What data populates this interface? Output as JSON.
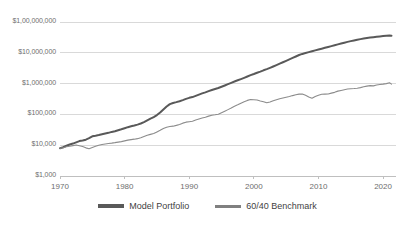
{
  "chart_data": {
    "type": "line",
    "title": "",
    "subtitle": "",
    "xlabel": "",
    "ylabel": "",
    "yscale": "log",
    "ylim": [
      1000,
      100000000
    ],
    "xlim": [
      1970,
      2022
    ],
    "grid": "horizontal",
    "legend_position": "bottom",
    "ytick_labels": [
      "$1,00,000,000",
      "$10,000,000",
      "$1,000,000",
      "$100,000",
      "$10,000",
      "$1,000"
    ],
    "ytick_values": [
      100000000,
      10000000,
      1000000,
      100000,
      10000,
      1000
    ],
    "xtick_labels": [
      "1970",
      "1980",
      "1990",
      "2000",
      "2010",
      "2020"
    ],
    "xtick_values": [
      1970,
      1980,
      1990,
      2000,
      2010,
      2020
    ],
    "colors": {
      "model_portfolio": "#595959",
      "benchmark": "#8c8c8c",
      "gridline": "#d9d9d9",
      "axis": "#bfbfbf",
      "tick_text": "#6e6e6e",
      "legend_text": "#3f3f3f"
    },
    "series": [
      {
        "name": "Model Portfolio",
        "color": "#595959",
        "width": 2.0,
        "x": [
          1970,
          1970.5,
          1971,
          1971.5,
          1972,
          1972.5,
          1973,
          1973.5,
          1974,
          1974.5,
          1975,
          1975.5,
          1976,
          1976.5,
          1977,
          1977.5,
          1978,
          1978.5,
          1979,
          1979.5,
          1980,
          1980.5,
          1981,
          1981.5,
          1982,
          1982.5,
          1983,
          1983.5,
          1984,
          1984.5,
          1985,
          1985.5,
          1986,
          1986.5,
          1987,
          1987.5,
          1988,
          1988.5,
          1989,
          1989.5,
          1990,
          1990.5,
          1991,
          1991.5,
          1992,
          1992.5,
          1993,
          1993.5,
          1994,
          1994.5,
          1995,
          1995.5,
          1996,
          1996.5,
          1997,
          1997.5,
          1998,
          1998.5,
          1999,
          1999.5,
          2000,
          2000.5,
          2001,
          2001.5,
          2002,
          2002.5,
          2003,
          2003.5,
          2004,
          2004.5,
          2005,
          2005.5,
          2006,
          2006.5,
          2007,
          2007.5,
          2008,
          2008.5,
          2009,
          2009.5,
          2010,
          2010.5,
          2011,
          2011.5,
          2012,
          2012.5,
          2013,
          2013.5,
          2014,
          2014.5,
          2015,
          2015.5,
          2016,
          2016.5,
          2017,
          2017.5,
          2018,
          2018.5,
          2019,
          2019.5,
          2020,
          2020.5,
          2021,
          2021.3
        ],
        "y": [
          8000,
          8600,
          9600,
          10500,
          11300,
          12400,
          13600,
          14200,
          15100,
          16900,
          19500,
          20300,
          21300,
          22600,
          23800,
          25200,
          27000,
          28400,
          30500,
          32800,
          35500,
          38500,
          41000,
          43500,
          46500,
          50500,
          56000,
          64000,
          73000,
          82000,
          95000,
          115000,
          145000,
          180000,
          215000,
          235000,
          250000,
          268000,
          292000,
          320000,
          345000,
          365000,
          400000,
          440000,
          480000,
          520000,
          570000,
          620000,
          670000,
          720000,
          790000,
          870000,
          960000,
          1060000,
          1170000,
          1280000,
          1400000,
          1540000,
          1700000,
          1880000,
          2050000,
          2250000,
          2450000,
          2700000,
          2950000,
          3250000,
          3600000,
          4000000,
          4450000,
          4950000,
          5500000,
          6100000,
          6800000,
          7600000,
          8500000,
          9200000,
          9800000,
          10500000,
          11200000,
          12000000,
          12800000,
          13600000,
          14500000,
          15500000,
          16500000,
          17600000,
          18800000,
          20000000,
          21300000,
          22600000,
          23900000,
          25200000,
          26500000,
          27800000,
          29000000,
          30200000,
          31200000,
          32000000,
          33000000,
          34000000,
          34800000,
          35500000,
          36200000,
          36000000
        ]
      },
      {
        "name": "60/40 Benchmark",
        "color": "#8c8c8c",
        "width": 1.1,
        "x": [
          1970,
          1970.5,
          1971,
          1971.5,
          1972,
          1972.5,
          1973,
          1973.5,
          1974,
          1974.5,
          1975,
          1975.5,
          1976,
          1976.5,
          1977,
          1977.5,
          1978,
          1978.5,
          1979,
          1979.5,
          1980,
          1980.5,
          1981,
          1981.5,
          1982,
          1982.5,
          1983,
          1983.5,
          1984,
          1984.5,
          1985,
          1985.5,
          1986,
          1986.5,
          1987,
          1987.5,
          1988,
          1988.5,
          1989,
          1989.5,
          1990,
          1990.5,
          1991,
          1991.5,
          1992,
          1992.5,
          1993,
          1993.5,
          1994,
          1994.5,
          1995,
          1995.5,
          1996,
          1996.5,
          1997,
          1997.5,
          1998,
          1998.5,
          1999,
          1999.5,
          2000,
          2000.5,
          2001,
          2001.5,
          2002,
          2002.5,
          2003,
          2003.5,
          2004,
          2004.5,
          2005,
          2005.5,
          2006,
          2006.5,
          2007,
          2007.5,
          2008,
          2008.5,
          2009,
          2009.5,
          2010,
          2010.5,
          2011,
          2011.5,
          2012,
          2012.5,
          2013,
          2013.5,
          2014,
          2014.5,
          2015,
          2015.5,
          2016,
          2016.5,
          2017,
          2017.5,
          2018,
          2018.5,
          2019,
          2019.5,
          2020,
          2020.5,
          2021,
          2021.3
        ],
        "y": [
          8000,
          8300,
          8900,
          9300,
          9700,
          10100,
          9600,
          9100,
          8200,
          7700,
          8400,
          9200,
          10000,
          10600,
          11000,
          11400,
          11700,
          12100,
          12600,
          13100,
          13800,
          14600,
          15200,
          15700,
          16300,
          17500,
          19200,
          21000,
          22500,
          24000,
          27000,
          30500,
          35000,
          38500,
          40500,
          41500,
          44000,
          47000,
          52000,
          56000,
          58000,
          60000,
          66000,
          71000,
          76000,
          81000,
          88000,
          94000,
          97000,
          101000,
          113000,
          127000,
          143000,
          161000,
          183000,
          205000,
          232000,
          258000,
          285000,
          305000,
          300000,
          292000,
          272000,
          258000,
          238000,
          252000,
          278000,
          300000,
          320000,
          340000,
          360000,
          382000,
          408000,
          432000,
          455000,
          462000,
          420000,
          370000,
          335000,
          380000,
          420000,
          450000,
          455000,
          462000,
          490000,
          520000,
          570000,
          600000,
          635000,
          665000,
          680000,
          690000,
          710000,
          740000,
          790000,
          830000,
          860000,
          845000,
          900000,
          940000,
          960000,
          1000000,
          1060000,
          960000
        ]
      }
    ]
  },
  "legend": {
    "entries": [
      {
        "label": "Model Portfolio"
      },
      {
        "label": "60/40 Benchmark"
      }
    ]
  }
}
